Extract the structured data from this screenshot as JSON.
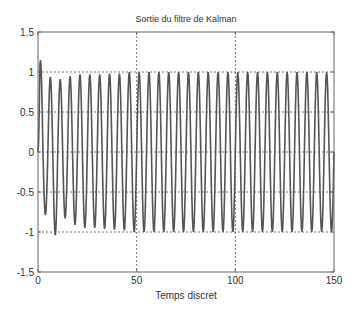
{
  "chart_data": {
    "type": "line",
    "title": "Sortie du filtre de Kalman",
    "xlabel": "Temps discret",
    "ylabel": "",
    "xlim": [
      0,
      150
    ],
    "ylim": [
      -1.5,
      1.5
    ],
    "xticks": [
      0,
      50,
      100,
      150
    ],
    "yticks": [
      -1.5,
      -1,
      -0.5,
      0,
      0.5,
      1,
      1.5
    ],
    "xtick_labels": [
      "0",
      "50",
      "100",
      "150"
    ],
    "ytick_labels": [
      "-1.5",
      "-1",
      "-0.5",
      "0",
      "0.5",
      "1",
      "1.5"
    ],
    "grid": true,
    "legend": null,
    "series": [
      {
        "name": "Sortie du filtre de Kalman",
        "color": "#555555",
        "description": "Oscillation of period ~5 samples; initial transient (peak ~1.15 at k~4, early peaks ~0.93, early troughs -0.8 to -1.05) converging to amplitude ~1 by k~50",
        "period": 5,
        "steady_amplitude": 1.0,
        "early_peaks": [
          1.15,
          0.94,
          0.91,
          0.95,
          0.97,
          0.97,
          0.97,
          0.98,
          0.98
        ],
        "early_troughs": [
          -0.79,
          -1.04,
          -0.83,
          -0.91,
          -0.95,
          -0.95,
          -0.96,
          -0.97,
          -0.98
        ]
      }
    ]
  },
  "colors": {
    "axis": "#555555",
    "grid": "#555555",
    "line": "#555555",
    "background": "#ffffff"
  }
}
